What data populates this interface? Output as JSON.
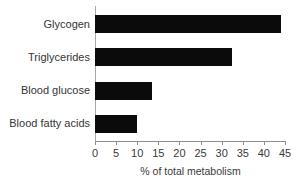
{
  "chart_data": {
    "type": "bar",
    "orientation": "horizontal",
    "title": "",
    "xlabel": "% of total metabolism",
    "ylabel": "",
    "categories": [
      "Glycogen",
      "Triglycerides",
      "Blood glucose",
      "Blood fatty acids"
    ],
    "values": [
      44,
      32.5,
      13.5,
      10
    ],
    "xlim": [
      0,
      45
    ],
    "xticks": [
      0,
      5,
      10,
      15,
      20,
      25,
      30,
      35,
      40,
      45
    ],
    "xtick_labels": [
      "0",
      "5",
      "10",
      "15",
      "20",
      "25",
      "30",
      "35",
      "40",
      "45"
    ],
    "grid": false,
    "legend": false,
    "bar_color": "#0b0b0b",
    "axis_color": "#8e8e8e",
    "text_color": "#353535"
  }
}
